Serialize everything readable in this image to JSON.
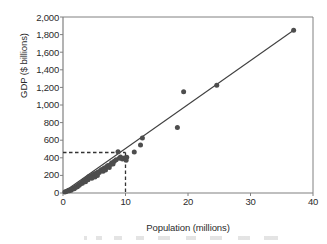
{
  "chart_data": {
    "type": "scatter",
    "title": "",
    "xlabel": "Population (millions)",
    "ylabel": "GDP ($ billions)",
    "xlim": [
      0,
      40
    ],
    "ylim": [
      0,
      2000
    ],
    "xticks": [
      "0",
      "10",
      "20",
      "30",
      "40"
    ],
    "xtick_values": [
      0,
      10,
      20,
      30,
      40
    ],
    "yticks": [
      "0",
      "200",
      "400",
      "600",
      "800",
      "1,000",
      "1,200",
      "1,400",
      "1,600",
      "1,800",
      "2,000"
    ],
    "ytick_values": [
      0,
      200,
      400,
      600,
      800,
      1000,
      1200,
      1400,
      1600,
      1800,
      2000
    ],
    "grid": false,
    "legend": "none",
    "marker_color": "#4d4d4d",
    "line_color": "#404040",
    "axis_color": "#808080",
    "points": [
      [
        0.3,
        12
      ],
      [
        0.5,
        18
      ],
      [
        0.7,
        22
      ],
      [
        0.9,
        30
      ],
      [
        1.0,
        25
      ],
      [
        1.2,
        38
      ],
      [
        1.3,
        30
      ],
      [
        1.5,
        45
      ],
      [
        1.6,
        55
      ],
      [
        1.8,
        48
      ],
      [
        2.0,
        62
      ],
      [
        2.1,
        75
      ],
      [
        2.3,
        70
      ],
      [
        2.5,
        95
      ],
      [
        2.6,
        88
      ],
      [
        2.8,
        105
      ],
      [
        3.0,
        120
      ],
      [
        3.1,
        110
      ],
      [
        3.3,
        135
      ],
      [
        3.5,
        145
      ],
      [
        3.6,
        128
      ],
      [
        3.8,
        160
      ],
      [
        4.0,
        150
      ],
      [
        4.1,
        185
      ],
      [
        4.3,
        175
      ],
      [
        4.5,
        195
      ],
      [
        4.6,
        168
      ],
      [
        4.8,
        205
      ],
      [
        5.0,
        215
      ],
      [
        5.1,
        182
      ],
      [
        5.3,
        225
      ],
      [
        5.5,
        198
      ],
      [
        5.6,
        240
      ],
      [
        5.8,
        232
      ],
      [
        6.0,
        255
      ],
      [
        6.2,
        268
      ],
      [
        6.4,
        248
      ],
      [
        6.6,
        285
      ],
      [
        6.8,
        262
      ],
      [
        7.0,
        300
      ],
      [
        7.2,
        312
      ],
      [
        7.4,
        290
      ],
      [
        7.6,
        325
      ],
      [
        7.8,
        345
      ],
      [
        8.0,
        330
      ],
      [
        8.2,
        360
      ],
      [
        8.5,
        378
      ],
      [
        8.8,
        470
      ],
      [
        9.0,
        395
      ],
      [
        9.2,
        410
      ],
      [
        9.5,
        385
      ],
      [
        9.8,
        398
      ],
      [
        10.0,
        390
      ],
      [
        10.1,
        372
      ],
      [
        10.2,
        405
      ],
      [
        11.4,
        465
      ],
      [
        12.4,
        545
      ],
      [
        12.7,
        625
      ],
      [
        18.3,
        745
      ],
      [
        19.3,
        1150
      ],
      [
        24.6,
        1225
      ],
      [
        36.9,
        1850
      ]
    ],
    "trendline": {
      "x_start": 0.0,
      "y_start": 5,
      "x_end": 36.9,
      "y_end": 1850,
      "description": "linear fit through origin"
    },
    "reference_lines": {
      "vertical_x": 10,
      "horizontal_y": 460,
      "style": "dashed"
    }
  }
}
